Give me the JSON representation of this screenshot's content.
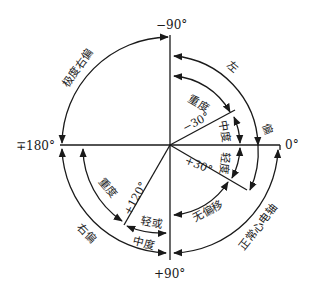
{
  "axis_labels": {
    "top": "−90°",
    "right": "0°",
    "left": "∓180°",
    "bottom": "+90°",
    "minus30": "−30°",
    "plus30": "+30°",
    "plus120": "+120°"
  },
  "region_labels": {
    "extreme_right_deviation": "极度右偏",
    "left": "左",
    "left_deviation": "偏",
    "severe_upper": "重度",
    "moderate_upper": "中度",
    "mild_right": "轻度",
    "no_deviation": "无偏移",
    "normal_axis": "正常心电轴",
    "right_deviation": "右偏",
    "severe_lower": "重度",
    "mild_lower": "轻或",
    "moderate_lower": "中度"
  },
  "colors": {
    "ink": "#1a1a1a",
    "background": "#ffffff"
  }
}
